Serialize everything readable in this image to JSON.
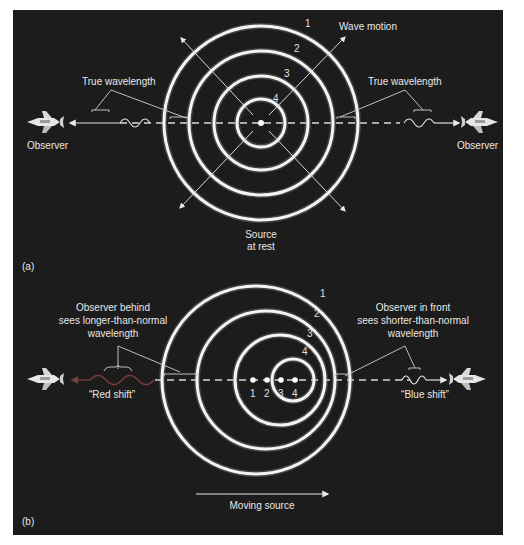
{
  "figure": {
    "background": "#1c1c1c",
    "ring_color": "#f4f4f4",
    "red_wave_color": "#7a4040",
    "panel_a": {
      "label": "(a)",
      "wave_labels": [
        "1",
        "2",
        "3",
        "4"
      ],
      "wave_motion_label": "Wave motion",
      "left_bracket_label": "True wavelength",
      "right_bracket_label": "True wavelength",
      "left_observer_label": "Observer",
      "right_observer_label": "Observer",
      "source_label_line1": "Source",
      "source_label_line2": "at rest"
    },
    "panel_b": {
      "label": "(b)",
      "wave_labels": [
        "1",
        "2",
        "3",
        "4"
      ],
      "source_position_labels": [
        "1",
        "2",
        "3",
        "4"
      ],
      "left_note_line1": "Observer behind",
      "left_note_line2": "sees longer-than-normal",
      "left_note_line3": "wavelength",
      "right_note_line1": "Observer in front",
      "right_note_line2": "sees shorter-than-normal",
      "right_note_line3": "wavelength",
      "red_shift_label": "“Red shift”",
      "blue_shift_label": "“Blue shift”",
      "moving_source_label": "Moving source"
    }
  }
}
